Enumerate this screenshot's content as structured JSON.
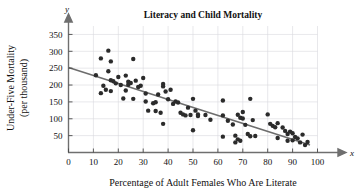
{
  "figure": {
    "width": 361,
    "height": 192,
    "background": "#ffffff"
  },
  "chart_data": {
    "type": "scatter",
    "title": "Literacy and Child Mortality",
    "xlabel": "Percentage of Adult Females Who Are Literate",
    "ylabel": "Under-Five Mortality (per thousand)",
    "ylabel_line1": "Under-Five Mortality",
    "ylabel_line2": "(per thousand)",
    "x_axis_name": "x",
    "y_axis_name": "y",
    "xlim": [
      0,
      100
    ],
    "ylim": [
      0,
      375
    ],
    "xticks": [
      0,
      10,
      20,
      30,
      40,
      50,
      60,
      70,
      80,
      90,
      100
    ],
    "yticks": [
      50,
      100,
      150,
      200,
      250,
      300,
      350
    ],
    "xtick_labels": [
      "0",
      "10",
      "20",
      "30",
      "40",
      "50",
      "60",
      "70",
      "80",
      "90",
      "100"
    ],
    "ytick_labels": [
      "50",
      "100",
      "150",
      "200",
      "250",
      "300",
      "350"
    ],
    "grid": true,
    "grid_color": "#d8d8dd",
    "legend": false,
    "point_color": "#2b2b2b",
    "point_radius": 2.2,
    "trend_line": {
      "label": "least-squares regression line",
      "color": "#6d6d6d",
      "x_start": 0,
      "y_start": 252,
      "x_end": 97,
      "y_end": 22
    },
    "points": [
      [
        11,
        229
      ],
      [
        13,
        279
      ],
      [
        13,
        176
      ],
      [
        14,
        198
      ],
      [
        15,
        186
      ],
      [
        16,
        302
      ],
      [
        16,
        241
      ],
      [
        17,
        270
      ],
      [
        17,
        214
      ],
      [
        17,
        182
      ],
      [
        18,
        211
      ],
      [
        19,
        205
      ],
      [
        20,
        224
      ],
      [
        21,
        200
      ],
      [
        22,
        160
      ],
      [
        23,
        228
      ],
      [
        23,
        184
      ],
      [
        24,
        210
      ],
      [
        24,
        201
      ],
      [
        25,
        206
      ],
      [
        26,
        277
      ],
      [
        26,
        159
      ],
      [
        27,
        213
      ],
      [
        28,
        194
      ],
      [
        29,
        198
      ],
      [
        30,
        221
      ],
      [
        31,
        151
      ],
      [
        31,
        175
      ],
      [
        32,
        124
      ],
      [
        34,
        146
      ],
      [
        35,
        149
      ],
      [
        35,
        123
      ],
      [
        36,
        172
      ],
      [
        37,
        118
      ],
      [
        38,
        203
      ],
      [
        38,
        196
      ],
      [
        38,
        85
      ],
      [
        39,
        181
      ],
      [
        40,
        158
      ],
      [
        41,
        186
      ],
      [
        42,
        144
      ],
      [
        43,
        151
      ],
      [
        44,
        148
      ],
      [
        45,
        118
      ],
      [
        46,
        113
      ],
      [
        47,
        110
      ],
      [
        48,
        133
      ],
      [
        49,
        111
      ],
      [
        50,
        159
      ],
      [
        50,
        66
      ],
      [
        51,
        124
      ],
      [
        52,
        113
      ],
      [
        52,
        108
      ],
      [
        55,
        111
      ],
      [
        57,
        97
      ],
      [
        62,
        154
      ],
      [
        62,
        110
      ],
      [
        62,
        47
      ],
      [
        64,
        94
      ],
      [
        66,
        83
      ],
      [
        67,
        50
      ],
      [
        67,
        30
      ],
      [
        68,
        112
      ],
      [
        68,
        39
      ],
      [
        69,
        103
      ],
      [
        69,
        35
      ],
      [
        70,
        120
      ],
      [
        70,
        101
      ],
      [
        71,
        82
      ],
      [
        72,
        55
      ],
      [
        73,
        159
      ],
      [
        73,
        48
      ],
      [
        74,
        96
      ],
      [
        75,
        49
      ],
      [
        80,
        113
      ],
      [
        81,
        85
      ],
      [
        82,
        79
      ],
      [
        83,
        75
      ],
      [
        84,
        87
      ],
      [
        84,
        43
      ],
      [
        86,
        74
      ],
      [
        87,
        64
      ],
      [
        88,
        55
      ],
      [
        88,
        35
      ],
      [
        89,
        62
      ],
      [
        90,
        57
      ],
      [
        90,
        36
      ],
      [
        91,
        46
      ],
      [
        92,
        42
      ],
      [
        93,
        30
      ],
      [
        94,
        53
      ],
      [
        95,
        22
      ],
      [
        96,
        31
      ]
    ]
  }
}
